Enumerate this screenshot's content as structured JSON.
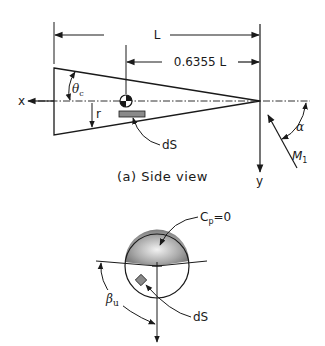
{
  "figure": {
    "side_view": {
      "caption": "(a) Side view",
      "dimension_total": "L",
      "dimension_cg": "0.6355 L",
      "axis_x_label": "x",
      "axis_y_label": "y",
      "cone_half_angle_label": "θ",
      "cone_half_angle_sub": "c",
      "radius_label": "r",
      "surface_element_label": "dS",
      "angle_of_attack_label": "α",
      "moment_label": "M",
      "moment_sub": "1"
    },
    "front_view": {
      "pressure_label": "C",
      "pressure_sub": "p",
      "pressure_value": "=0",
      "surface_element_label": "dS",
      "angle_label": "β",
      "angle_sub": "u"
    },
    "colors": {
      "line": "#1a1a1a",
      "shade": "#8a8a8a",
      "shade_light": "#e6e6e6",
      "background": "#ffffff"
    }
  }
}
